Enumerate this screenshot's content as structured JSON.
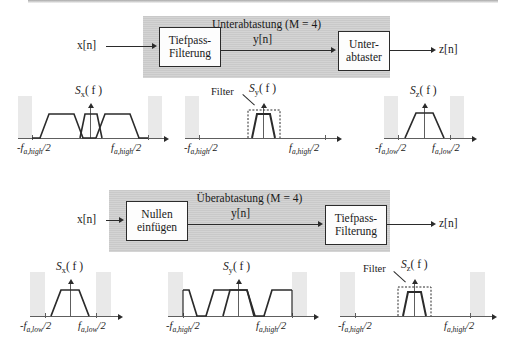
{
  "figure": {
    "title_hidden": "Unterabtastung und Ueberabtastung Blockdiagramme mit Spektren",
    "stroke_color": "#2b2b2b",
    "gray_block_color": "#c9c9c9",
    "band_color": "#e9e9e9"
  },
  "top_system": {
    "title": "Unterabtastung (M = 4)",
    "title_name": "Unterabtastung",
    "factor_label": "M = 4",
    "input_signal": "x[n]",
    "middle_signal": "y[n]",
    "output_signal": "z[n]",
    "blocks": [
      {
        "line1": "Tiefpass-",
        "line2": "Filterung"
      },
      {
        "line1": "Unter-",
        "line2": "abtaster"
      }
    ],
    "plots": [
      {
        "id": "top-sx",
        "label": "S",
        "label_sub": "x",
        "label_arg": "( f )",
        "xtick_left": "-f",
        "xtick_left_sub": "a,high",
        "xtick_left_tail": "/2",
        "xtick_right": "f",
        "xtick_right_sub": "a,high",
        "xtick_right_tail": "/2",
        "filter_overlay": false,
        "trapezoid_count": 3,
        "description": "Drei Trapeze: Basisband und zwei Spiegelspektren"
      },
      {
        "id": "top-sy",
        "label": "S",
        "label_sub": "y",
        "label_arg": "( f )",
        "xtick_left": "-f",
        "xtick_left_sub": "a,high",
        "xtick_left_tail": "/2",
        "xtick_right": "f",
        "xtick_right_sub": "a,high",
        "xtick_right_tail": "/2",
        "filter_overlay": true,
        "filter_label": "Filter",
        "trapezoid_count": 1,
        "description": "Nur das Basisband bleibt nach der Tiefpass-Filterung"
      },
      {
        "id": "top-sz",
        "label": "S",
        "label_sub": "z",
        "label_arg": "( f )",
        "xtick_left": "-f",
        "xtick_left_sub": "a,low",
        "xtick_left_tail": "/2",
        "xtick_right": "f",
        "xtick_right_sub": "a,low",
        "xtick_right_tail": "/2",
        "filter_overlay": false,
        "trapezoid_count": 1,
        "description": "Basisband bei reduzierter Abtastrate"
      }
    ]
  },
  "bottom_system": {
    "title": "Überabtastung (M = 4)",
    "title_name": "Überabtastung",
    "factor_label": "M = 4",
    "input_signal": "x[n]",
    "middle_signal": "y[n]",
    "output_signal": "z[n]",
    "blocks": [
      {
        "line1": "Nullen",
        "line2": "einfügen"
      },
      {
        "line1": "Tiefpass-",
        "line2": "Filterung"
      }
    ],
    "plots": [
      {
        "id": "bot-sx",
        "label": "S",
        "label_sub": "x",
        "label_arg": "( f )",
        "xtick_left": "-f",
        "xtick_left_sub": "a,low",
        "xtick_left_tail": "/2",
        "xtick_right": "f",
        "xtick_right_sub": "a,low",
        "xtick_right_tail": "/2",
        "filter_overlay": false,
        "trapezoid_count": 1,
        "description": "Basisband bei niedriger Abtastrate"
      },
      {
        "id": "bot-sy",
        "label": "S",
        "label_sub": "y",
        "label_arg": "( f )",
        "xtick_left": "-f",
        "xtick_left_sub": "a,high",
        "xtick_left_tail": "/2",
        "xtick_right": "f",
        "xtick_right_sub": "a,high",
        "xtick_right_tail": "/2",
        "filter_overlay": false,
        "trapezoid_count": 5,
        "description": "Fünf Spektralbilder nach dem Einfügen von Nullen"
      },
      {
        "id": "bot-sz",
        "label": "S",
        "label_sub": "z",
        "label_arg": "( f )",
        "xtick_left": "-f",
        "xtick_left_sub": "a,high",
        "xtick_left_tail": "/2",
        "xtick_right": "f",
        "xtick_right_sub": "a,high",
        "xtick_right_tail": "/2",
        "filter_overlay": true,
        "filter_label": "Filter",
        "trapezoid_count": 1,
        "description": "Nur das Basisband bleibt nach der Tiefpass-Filterung"
      }
    ]
  }
}
